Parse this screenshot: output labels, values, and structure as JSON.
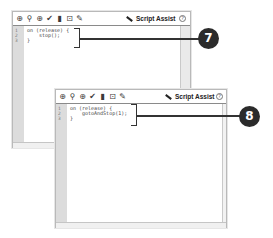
{
  "toolbar_icons": [
    {
      "name": "add-statement-icon",
      "glyph": "⊕"
    },
    {
      "name": "find-icon",
      "glyph": "⚲"
    },
    {
      "name": "insert-target-path-icon",
      "glyph": "⊕"
    },
    {
      "name": "check-syntax-icon",
      "glyph": "✔"
    },
    {
      "name": "auto-format-icon",
      "glyph": "▮"
    },
    {
      "name": "show-code-hint-icon",
      "glyph": "⊡"
    },
    {
      "name": "debug-options-icon",
      "glyph": "✎"
    }
  ],
  "window1": {
    "script_assist_label": "Script Assist",
    "help_glyph": "?",
    "line_numbers": [
      "1",
      "2",
      "3"
    ],
    "code_lines": [
      "on (release) {",
      "    stop();",
      "}"
    ],
    "callout": "7"
  },
  "window2": {
    "script_assist_label": "Script Assist",
    "help_glyph": "?",
    "line_numbers": [
      "1",
      "2",
      "3"
    ],
    "code_lines": [
      "on (release) {",
      "    gotoAndStop(1);",
      "}"
    ],
    "callout": "8"
  }
}
